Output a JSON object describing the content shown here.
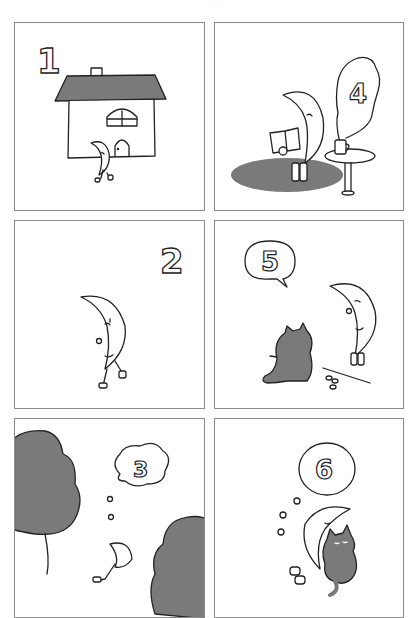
{
  "comic": {
    "page_marker": "· · ·",
    "colors": {
      "ink": "#222222",
      "tone": "#7a7a7a",
      "border": "#8a8a8a",
      "background": "#ffffff"
    },
    "panels": [
      {
        "id": "p1",
        "number": "1",
        "scene": "moon character walking out of a house with gray roof and chimney",
        "number_style": "outlined"
      },
      {
        "id": "p2",
        "number": "2",
        "scene": "moon character walking alone",
        "number_style": "outlined"
      },
      {
        "id": "p3",
        "number": "3",
        "scene": "moon character lying on back between two gray trees, thinking",
        "number_style": "thought-bubble"
      },
      {
        "id": "p4",
        "number": "4",
        "scene": "moon character reading a book on a gray rug beside a table with a steaming mug",
        "number_style": "steam-cloud"
      },
      {
        "id": "p5",
        "number": "5",
        "scene": "moon character meeting a dark gray cat sitting on the ground",
        "number_style": "speech-bubble"
      },
      {
        "id": "p6",
        "number": "6",
        "scene": "moon character sleeping, hugging the gray cat",
        "number_style": "dream-bubble"
      }
    ]
  }
}
